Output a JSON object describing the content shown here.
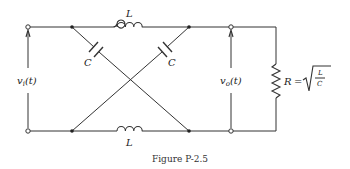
{
  "figure": {
    "caption": "Figure P-2.5"
  },
  "components": {
    "inductor_top": {
      "label": "L"
    },
    "inductor_bottom": {
      "label": "L"
    },
    "capacitor_left": {
      "label": "C"
    },
    "capacitor_right": {
      "label": "C"
    },
    "resistor": {
      "label": "R",
      "equals": "=",
      "formula_numerator": "L",
      "formula_denominator": "C"
    }
  },
  "signals": {
    "input": {
      "label": "v",
      "subscript": "i",
      "arg": "(t)"
    },
    "output": {
      "label": "v",
      "subscript": "o",
      "arg": "(t)"
    }
  },
  "colors": {
    "line": "#333333",
    "background": "#ffffff"
  }
}
